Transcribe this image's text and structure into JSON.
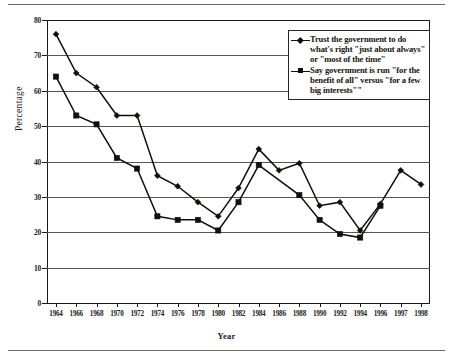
{
  "figure": {
    "y_axis_title": "Percentage",
    "x_axis_title": "Year"
  },
  "legend": {
    "entries": [
      {
        "marker": "diamond-marker",
        "label": "Trust the government to do what's right \"just about always\" or \"most of the time\""
      },
      {
        "marker": "square-marker",
        "label": "Say government is run \"for the benefit of all\" versus \"for a few big interests\"\""
      }
    ]
  },
  "chart_data": {
    "type": "line",
    "title": "",
    "xlabel": "Year",
    "ylabel": "Percentage",
    "ylim": [
      0,
      80
    ],
    "yticks": [
      0,
      10,
      20,
      30,
      40,
      50,
      60,
      70,
      80
    ],
    "grid": "horizontal",
    "legend_position": "upper-right",
    "categories": [
      "1964",
      "1966",
      "1968",
      "1970",
      "1972",
      "1974",
      "1976",
      "1978",
      "1980",
      "1982",
      "1984",
      "1986",
      "1988",
      "1990",
      "1992",
      "1994",
      "1996",
      "1997",
      "1998"
    ],
    "series": [
      {
        "name": "Trust the government to do what's right \"just about always\" or \"most of the time\"",
        "marker": "diamond",
        "values": [
          76,
          65,
          61,
          53,
          53,
          36,
          33,
          28.5,
          24.5,
          32.5,
          43.5,
          37.5,
          39.5,
          27.5,
          28.5,
          20.5,
          28,
          37.5,
          33.5
        ]
      },
      {
        "name": "Say government is run \"for the benefit of all\" versus \"for a few big interests\"\"",
        "marker": "square",
        "values": [
          64,
          53,
          50.5,
          41,
          38,
          24.5,
          23.5,
          23.5,
          20.5,
          28.5,
          39,
          null,
          30.5,
          23.5,
          19.5,
          18.5,
          27.5,
          null,
          null
        ]
      }
    ]
  },
  "colors": {
    "ink": "#100f0c",
    "grid": "#585550",
    "rule": "#6e6a63",
    "background": "#ffffff"
  }
}
